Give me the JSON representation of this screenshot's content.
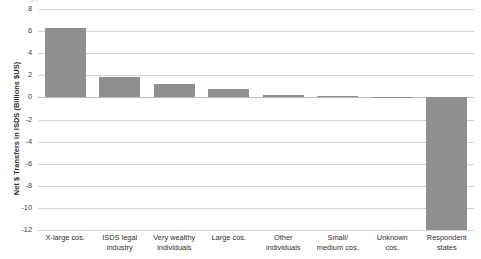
{
  "chart_data": {
    "type": "bar",
    "title": "",
    "xlabel": "",
    "ylabel": "Net $ Transfers in ISDS (Billions $US)",
    "ylim": [
      -12,
      8
    ],
    "ytick_step": 2,
    "yticks": [
      "8",
      "6",
      "4",
      "2",
      "0",
      "-2",
      "-4",
      "-6",
      "-8",
      "-10",
      "-12"
    ],
    "grid": true,
    "legend": "none",
    "bar_color": "#8f8f8f",
    "grid_color": "#d3d3d3",
    "categories": [
      "X-large cos.",
      "ISDS legal\nindustry",
      "Very wealthy\nindividuals",
      "Large cos.",
      "Other\nindividuals",
      "Small/\nmedium cos.",
      "Unknown\ncos.",
      "Respondent\nstates"
    ],
    "values": [
      6.25,
      1.85,
      1.25,
      0.8,
      0.25,
      0.1,
      0.02,
      -12.0
    ]
  },
  "axis": {
    "clipped_top_tick": "10"
  }
}
